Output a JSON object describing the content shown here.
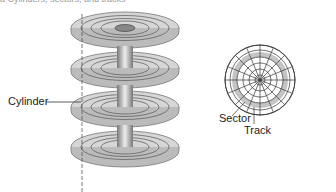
{
  "caption": "a   Cylinders, sectors, and tracks",
  "labels": {
    "cylinder": "Cylinder",
    "sector": "Sector",
    "track": "Track"
  },
  "colors": {
    "platter": "#d4d4d4",
    "platter_edge": "#888888",
    "spindle": "#9a9a9a",
    "highlight": "#c8c8c8",
    "line": "#333333"
  }
}
